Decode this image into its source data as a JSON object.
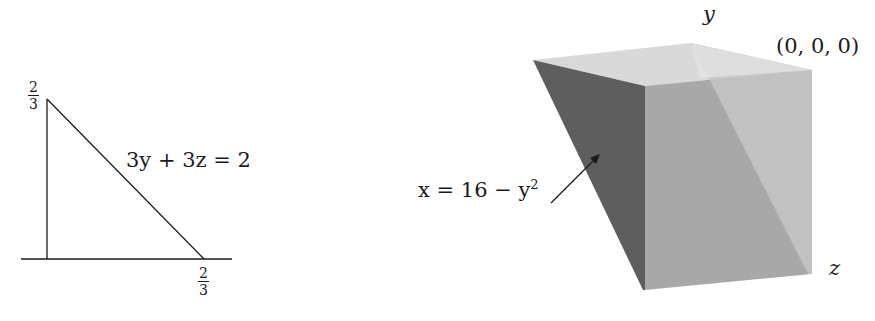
{
  "left_figure": {
    "description": "Triangular cross-section in the yz-plane",
    "equation_label": "3y + 3z = 2",
    "vertical_intercept": {
      "numerator": "2",
      "denominator": "3"
    },
    "horizontal_intercept": {
      "numerator": "2",
      "denominator": "3"
    }
  },
  "right_figure": {
    "description": "Shaded 3D solid (wedge) bounded by parabolic cylinder",
    "axis_y_label": "y",
    "axis_z_label": "z",
    "origin_label": "(0, 0, 0)",
    "surface_label_prefix": "x = 16 − y",
    "surface_label_exponent": "2",
    "colors": {
      "dark_face": "#5e5e5e",
      "front_face": "#a9a9a9",
      "right_face": "#c4c4c4",
      "top_face": "#d6d6d6"
    }
  }
}
